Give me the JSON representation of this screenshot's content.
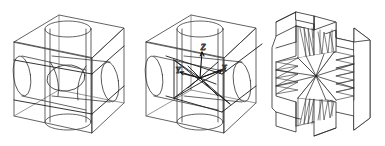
{
  "figure": {
    "kind": "line-drawing",
    "background_color": "#ffffff",
    "line_color": "#3c3c3c",
    "heavy_line_color": "#1a1a1a",
    "panel_count": 3
  },
  "panels": [
    {
      "id": "panel-1",
      "name": "wireframe-cube-with-three-cylinders",
      "description": "Transparent wireframe cube containing three mutually orthogonal intersecting cylinders",
      "labels": []
    },
    {
      "id": "panel-2",
      "name": "cube-with-labeled-axes",
      "description": "Same cube and cylinders overlaid with a tetrahedral/diagonal wireframe and a labeled coordinate frame at the centre",
      "labels": [
        {
          "text": "Z",
          "name": "axis-label-z"
        },
        {
          "text": "Y",
          "name": "axis-label-y"
        },
        {
          "text": "X",
          "name": "axis-label-x"
        }
      ]
    },
    {
      "id": "panel-3",
      "name": "triangulated-solid-mesh",
      "description": "Resulting solid block with cross-shaped cut, surfaces filled with a triangular mesh",
      "labels": []
    }
  ],
  "axes": {
    "z": "Z",
    "y": "Y",
    "x": "X"
  }
}
